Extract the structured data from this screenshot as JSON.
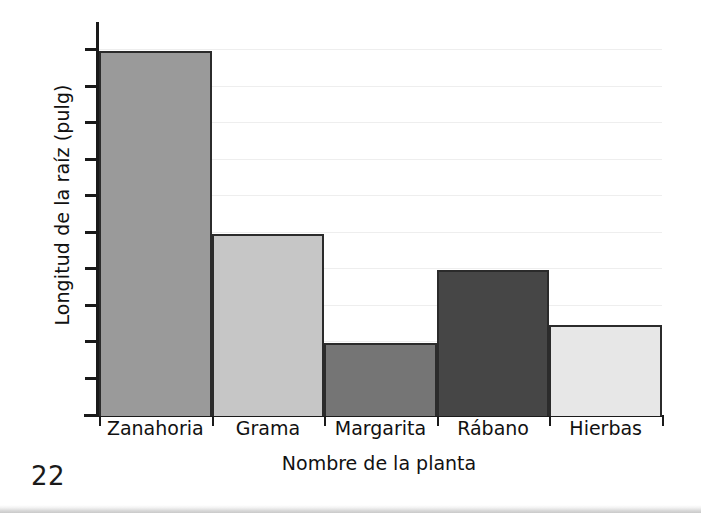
{
  "page": {
    "page_number": "22"
  },
  "chart_data": {
    "type": "bar",
    "title": "",
    "xlabel": "Nombre de la planta",
    "ylabel": "Longitud de la raíz (pulg)",
    "categories": [
      "Zanahoria",
      "Grama",
      "Margarita",
      "Rábano",
      "Hierbas"
    ],
    "values": [
      10,
      5,
      2,
      4,
      2.5
    ],
    "ylim": [
      0,
      10.75
    ],
    "ytick_values": [
      1,
      2,
      3,
      4,
      5,
      6,
      7,
      8,
      9,
      10
    ],
    "ytick_labels": [
      "",
      "",
      "",
      "",
      "",
      "",
      "",
      "",
      "",
      ""
    ],
    "grid": true,
    "gridline_values": [
      1,
      2,
      3,
      4,
      5,
      6,
      7,
      8,
      9,
      10
    ],
    "legend": "none",
    "bar_colors": [
      "#9a9a9a",
      "#c6c6c6",
      "#757575",
      "#464646",
      "#e7e7e7"
    ],
    "bar_edge_color": "#2b2b2b",
    "gridline_color": "#eeeeee",
    "axis_color": "#1a1a1a",
    "background_color": "#ffffff",
    "bars": [
      {
        "category": "Zanahoria",
        "value": 10,
        "color": "#9a9a9a"
      },
      {
        "category": "Grama",
        "value": 5,
        "color": "#c6c6c6"
      },
      {
        "category": "Margarita",
        "value": 2,
        "color": "#757575"
      },
      {
        "category": "Rábano",
        "value": 4,
        "color": "#464646"
      },
      {
        "category": "Hierbas",
        "value": 2.5,
        "color": "#e7e7e7"
      }
    ]
  }
}
